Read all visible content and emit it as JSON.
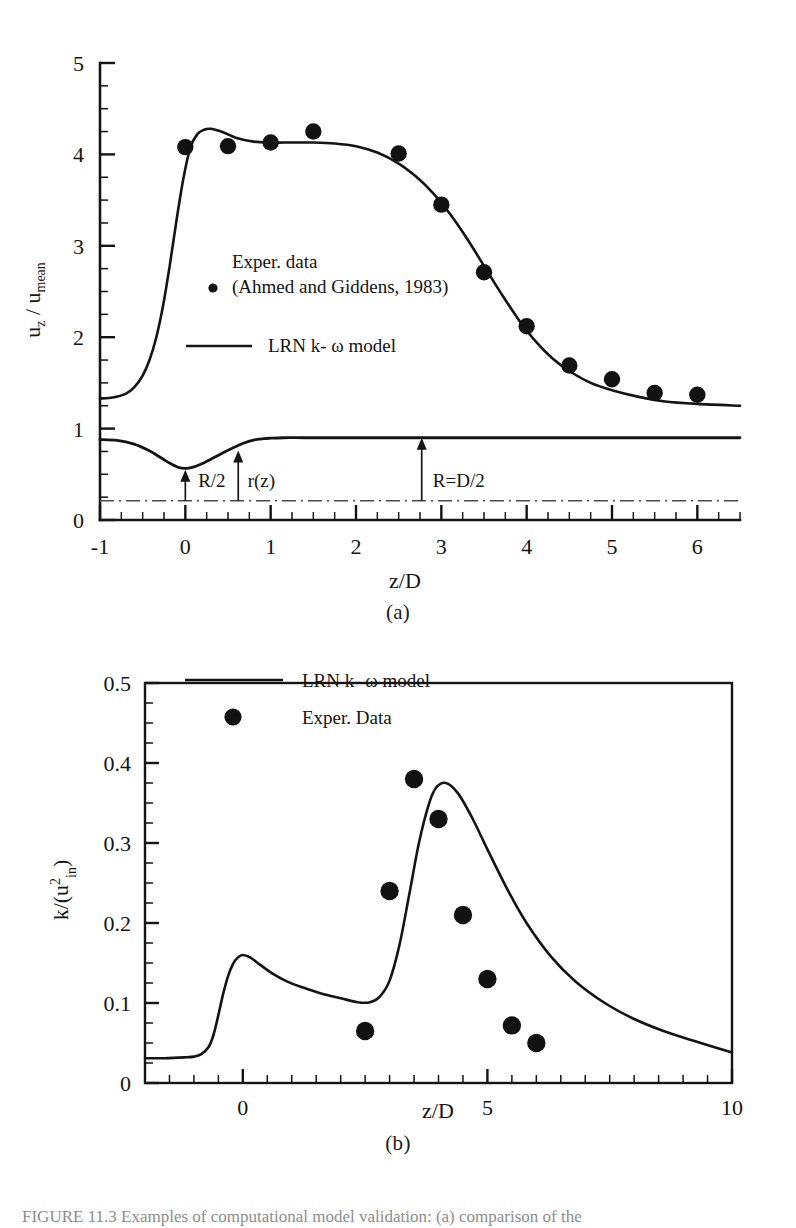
{
  "figure": {
    "panel_a_label": "(a)",
    "panel_b_label": "(b)",
    "caption": "FIGURE 11.3   Examples of computational model validation: (a) comparison of the"
  },
  "chart_data": [
    {
      "id": "panel-a",
      "type": "line",
      "title": "",
      "xlabel": "z/D",
      "ylabel": "u_z / u_mean",
      "ylabel_parts": {
        "base1": "u",
        "sub1": "z",
        "mid": " / ",
        "base2": "u",
        "sub2": "mean"
      },
      "xlim": [
        -1,
        6.5
      ],
      "ylim": [
        0,
        5
      ],
      "xticks": [
        -1,
        0,
        1,
        2,
        3,
        4,
        5,
        6
      ],
      "xticklabels": [
        "-1",
        "0",
        "1",
        "2",
        "3",
        "4",
        "5",
        "6"
      ],
      "yticks": [
        0,
        1,
        2,
        3,
        4,
        5
      ],
      "yticklabels": [
        "0",
        "1",
        "2",
        "3",
        "4",
        "5"
      ],
      "xminor_step": 0.25,
      "yminor_step": 0.25,
      "grid": false,
      "legend_position": "center-left",
      "legend": [
        {
          "marker": "dot",
          "label_line1": "Exper. data",
          "label_line2": "(Ahmed and Giddens, 1983)"
        },
        {
          "marker": "line",
          "label_line1": "LRN k- ω model",
          "label_line2": ""
        }
      ],
      "series": [
        {
          "name": "LRN k-ω model",
          "style": "line",
          "x": [
            -1.0,
            -0.85,
            -0.7,
            -0.6,
            -0.5,
            -0.42,
            -0.34,
            -0.26,
            -0.18,
            -0.1,
            -0.02,
            0.06,
            0.14,
            0.22,
            0.3,
            0.45,
            0.6,
            0.8,
            1.0,
            1.25,
            1.5,
            1.75,
            2.0,
            2.25,
            2.5,
            2.7,
            2.9,
            3.1,
            3.3,
            3.5,
            3.7,
            3.9,
            4.1,
            4.3,
            4.5,
            4.75,
            5.0,
            5.3,
            5.6,
            6.0,
            6.5
          ],
          "y": [
            1.33,
            1.34,
            1.38,
            1.45,
            1.58,
            1.75,
            2.0,
            2.35,
            2.8,
            3.3,
            3.75,
            4.08,
            4.22,
            4.27,
            4.28,
            4.24,
            4.18,
            4.14,
            4.13,
            4.13,
            4.13,
            4.12,
            4.09,
            4.02,
            3.9,
            3.76,
            3.58,
            3.35,
            3.08,
            2.78,
            2.48,
            2.2,
            1.96,
            1.77,
            1.63,
            1.5,
            1.42,
            1.35,
            1.3,
            1.27,
            1.25
          ]
        },
        {
          "name": "Exper. data (Ahmed and Giddens, 1983)",
          "style": "scatter",
          "x": [
            0.0,
            0.5,
            1.0,
            1.5,
            2.5,
            3.0,
            3.5,
            4.0,
            4.5,
            5.0,
            5.5,
            6.0
          ],
          "y": [
            4.08,
            4.09,
            4.13,
            4.25,
            4.01,
            3.45,
            2.71,
            2.12,
            1.69,
            1.54,
            1.39,
            1.37
          ]
        },
        {
          "name": "Vessel wall r(z)",
          "style": "wall",
          "x": [
            -1.0,
            -0.8,
            -0.6,
            -0.45,
            -0.3,
            -0.18,
            -0.08,
            0.0,
            0.08,
            0.18,
            0.3,
            0.42,
            0.55,
            0.68,
            0.8,
            0.92,
            1.0,
            1.15,
            1.4,
            2.0,
            3.0,
            4.0,
            5.0,
            6.0,
            6.5
          ],
          "y": [
            0.88,
            0.87,
            0.83,
            0.77,
            0.69,
            0.62,
            0.575,
            0.565,
            0.575,
            0.61,
            0.665,
            0.725,
            0.785,
            0.84,
            0.875,
            0.89,
            0.895,
            0.9,
            0.9,
            0.9,
            0.9,
            0.9,
            0.9,
            0.9,
            0.9
          ]
        }
      ],
      "centerline": {
        "y": 0.21,
        "style": "dash-dot"
      },
      "annotations": [
        {
          "label": "R/2",
          "x": 0.0,
          "arrow_from_y": 0.21,
          "arrow_to_y": 0.55,
          "text_x": 0.15,
          "text_y": 0.36
        },
        {
          "label": "r(z)",
          "x": 0.62,
          "arrow_from_y": 0.21,
          "arrow_to_y": 0.76,
          "text_x": 0.73,
          "text_y": 0.36
        },
        {
          "label": "R=D/2",
          "x": 2.77,
          "arrow_from_y": 0.21,
          "arrow_to_y": 0.9,
          "text_x": 2.9,
          "text_y": 0.36
        }
      ]
    },
    {
      "id": "panel-b",
      "type": "line",
      "title": "",
      "xlabel": "z/D",
      "ylabel": "k/(u_in^2)",
      "ylabel_parts": {
        "prefix": "k/(u",
        "sup": "2",
        "sub": "in",
        "suffix": ")"
      },
      "xlim": [
        -2,
        10
      ],
      "ylim": [
        0,
        0.5
      ],
      "xticks": [
        0,
        5,
        10
      ],
      "xticklabels": [
        "0",
        "5",
        "10"
      ],
      "yticks": [
        0,
        0.1,
        0.2,
        0.3,
        0.4,
        0.5
      ],
      "yticklabels": [
        "0",
        "0.1",
        "0.2",
        "0.3",
        "0.4",
        "0.5"
      ],
      "xminor_step": 0.5,
      "yminor_step": 0.025,
      "grid": false,
      "legend_position": "top-left",
      "legend": [
        {
          "marker": "line",
          "label_line1": "LRN k- ω model",
          "label_line2": ""
        },
        {
          "marker": "dot",
          "label_line1": "Exper. Data",
          "label_line2": ""
        }
      ],
      "series": [
        {
          "name": "LRN k-ω model",
          "style": "line",
          "x": [
            -2.0,
            -1.6,
            -1.2,
            -1.0,
            -0.85,
            -0.7,
            -0.6,
            -0.5,
            -0.4,
            -0.3,
            -0.2,
            -0.1,
            0.0,
            0.15,
            0.35,
            0.6,
            0.9,
            1.2,
            1.6,
            2.0,
            2.35,
            2.6,
            2.8,
            3.0,
            3.2,
            3.4,
            3.6,
            3.8,
            3.95,
            4.15,
            4.4,
            4.7,
            5.0,
            5.4,
            5.8,
            6.3,
            6.8,
            7.4,
            8.0,
            8.6,
            9.2,
            10.0
          ],
          "y": [
            0.031,
            0.031,
            0.032,
            0.033,
            0.036,
            0.045,
            0.06,
            0.085,
            0.112,
            0.134,
            0.149,
            0.157,
            0.16,
            0.157,
            0.148,
            0.137,
            0.127,
            0.12,
            0.112,
            0.106,
            0.101,
            0.101,
            0.108,
            0.128,
            0.172,
            0.235,
            0.3,
            0.348,
            0.369,
            0.375,
            0.362,
            0.33,
            0.292,
            0.243,
            0.2,
            0.158,
            0.127,
            0.1,
            0.08,
            0.065,
            0.053,
            0.038
          ]
        },
        {
          "name": "Exper. Data",
          "style": "scatter",
          "x": [
            2.5,
            3.0,
            3.5,
            4.0,
            4.5,
            5.0,
            5.5,
            6.0
          ],
          "y": [
            0.065,
            0.24,
            0.38,
            0.33,
            0.21,
            0.13,
            0.072,
            0.05
          ]
        }
      ]
    }
  ]
}
